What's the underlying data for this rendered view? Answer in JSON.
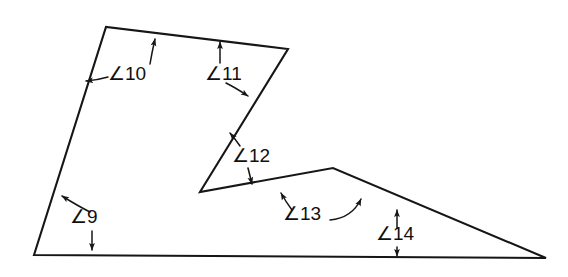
{
  "figure": {
    "kind": "geometry-diagram",
    "background_color": "#ffffff",
    "stroke_color": "#161616",
    "canvas": {
      "width": 568,
      "height": 277
    },
    "polygon": {
      "name": "concave-polygon",
      "closed": true,
      "vertices": [
        {
          "name": "bottom-left",
          "x": 34,
          "y": 255
        },
        {
          "name": "top-left",
          "x": 106,
          "y": 27
        },
        {
          "name": "top-right",
          "x": 288,
          "y": 49
        },
        {
          "name": "notch-left",
          "x": 200,
          "y": 192
        },
        {
          "name": "ridge-peak",
          "x": 333,
          "y": 168
        },
        {
          "name": "bottom-right",
          "x": 546,
          "y": 258
        }
      ]
    },
    "angle_labels": [
      {
        "id": "angle-9",
        "text": "∠9",
        "x": 70,
        "y": 223,
        "vertex": "bottom-left"
      },
      {
        "id": "angle-10",
        "text": "∠10",
        "x": 108,
        "y": 80,
        "vertex": "top-left"
      },
      {
        "id": "angle-11",
        "text": "∠11",
        "x": 205,
        "y": 80,
        "vertex": "top-right"
      },
      {
        "id": "angle-12",
        "text": "∠12",
        "x": 232,
        "y": 162,
        "vertex": "notch-left"
      },
      {
        "id": "angle-13",
        "text": "∠13",
        "x": 283,
        "y": 220,
        "vertex": "ridge-peak"
      },
      {
        "id": "angle-14",
        "text": "∠14",
        "x": 376,
        "y": 240,
        "vertex": "bottom-right"
      }
    ],
    "notes": {
      "label_count": 6,
      "labels_list": "∠9, ∠10, ∠11, ∠12, ∠13, ∠14"
    }
  }
}
